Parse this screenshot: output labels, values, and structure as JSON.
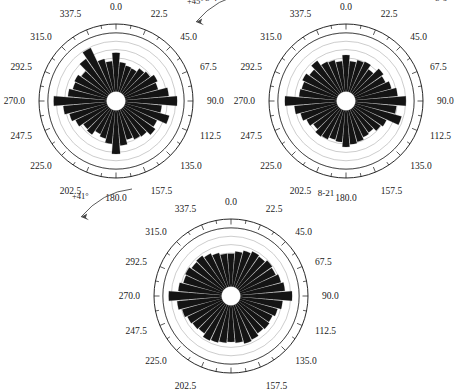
{
  "figure": {
    "type": "rose-diagram-figure",
    "panel_count": 3,
    "background": "#ffffff",
    "petal_color": "#141414",
    "grid_color": "#9a9a9a",
    "axis_color": "#111111"
  },
  "chart_data": [
    {
      "type": "bar",
      "subtype": "polar-rose",
      "id": "8-4",
      "rotation_label": "+179°",
      "title": "8-4",
      "xlabel": "",
      "ylabel": "",
      "bin_width_deg": 10,
      "n_bins": 36,
      "grid_rings": 7,
      "inner_blank_fraction": 0.14,
      "rlim": [
        0,
        1
      ],
      "tick_interval_deg": 11.25,
      "tick_labels": [
        "0.0",
        "22.5",
        "45.0",
        "67.5",
        "90.0",
        "112.5",
        "135.0",
        "157.5",
        "180.0",
        "202.5",
        "225.0",
        "247.5",
        "270.0",
        "292.5",
        "315.0",
        "337.5"
      ],
      "tick_label_angles": [
        0,
        22.5,
        45,
        67.5,
        90,
        112.5,
        135,
        157.5,
        180,
        202.5,
        225,
        247.5,
        270,
        292.5,
        315,
        337.5
      ],
      "categories": [
        0,
        10,
        20,
        30,
        40,
        50,
        60,
        70,
        80,
        90,
        100,
        110,
        120,
        130,
        140,
        150,
        160,
        170,
        180,
        190,
        200,
        210,
        220,
        230,
        240,
        250,
        260,
        270,
        280,
        290,
        300,
        310,
        320,
        330,
        340,
        350
      ],
      "values": [
        0.66,
        0.5,
        0.46,
        0.45,
        0.52,
        0.55,
        0.62,
        0.58,
        0.74,
        0.88,
        0.62,
        0.78,
        0.61,
        0.66,
        0.58,
        0.56,
        0.52,
        0.6,
        0.74,
        0.57,
        0.5,
        0.46,
        0.54,
        0.52,
        0.6,
        0.66,
        0.74,
        0.9,
        0.66,
        0.6,
        0.62,
        0.56,
        0.72,
        0.84,
        0.58,
        0.52
      ],
      "legend": []
    },
    {
      "type": "bar",
      "subtype": "polar-rose",
      "id": "8-6",
      "rotation_label": "+45°",
      "title": "8-6",
      "xlabel": "",
      "ylabel": "",
      "bin_width_deg": 10,
      "n_bins": 36,
      "grid_rings": 7,
      "inner_blank_fraction": 0.14,
      "rlim": [
        0,
        1
      ],
      "tick_interval_deg": 11.25,
      "tick_labels": [
        "0.0",
        "22.5",
        "45.0",
        "67.5",
        "90.0",
        "112.5",
        "135.0",
        "157.5",
        "180.0",
        "202.5",
        "225.0",
        "247.5",
        "270.0",
        "292.5",
        "315.0",
        "337.5"
      ],
      "tick_label_angles": [
        0,
        22.5,
        45,
        67.5,
        90,
        112.5,
        135,
        157.5,
        180,
        202.5,
        225,
        247.5,
        270,
        292.5,
        315,
        337.5
      ],
      "categories": [
        0,
        10,
        20,
        30,
        40,
        50,
        60,
        70,
        80,
        90,
        100,
        110,
        120,
        130,
        140,
        150,
        160,
        170,
        180,
        190,
        200,
        210,
        220,
        230,
        240,
        250,
        260,
        270,
        280,
        290,
        300,
        310,
        320,
        330,
        340,
        350
      ],
      "values": [
        0.62,
        0.52,
        0.56,
        0.58,
        0.5,
        0.62,
        0.58,
        0.64,
        0.72,
        0.86,
        0.7,
        0.82,
        0.6,
        0.56,
        0.5,
        0.52,
        0.56,
        0.58,
        0.62,
        0.54,
        0.52,
        0.56,
        0.58,
        0.52,
        0.58,
        0.64,
        0.72,
        0.88,
        0.64,
        0.62,
        0.66,
        0.6,
        0.68,
        0.58,
        0.56,
        0.52
      ],
      "legend": []
    },
    {
      "type": "bar",
      "subtype": "polar-rose",
      "id": "8-21",
      "rotation_label": "+41°",
      "title": "8-21",
      "xlabel": "",
      "ylabel": "",
      "bin_width_deg": 10,
      "n_bins": 36,
      "grid_rings": 7,
      "inner_blank_fraction": 0.14,
      "rlim": [
        0,
        1
      ],
      "tick_interval_deg": 11.25,
      "tick_labels": [
        "0.0",
        "22.5",
        "45.0",
        "67.5",
        "90.0",
        "112.5",
        "135.0",
        "157.5",
        "180.0",
        "202.5",
        "225.0",
        "247.5",
        "270.0",
        "292.5",
        "315.0",
        "337.5"
      ],
      "tick_label_angles": [
        0,
        22.5,
        45,
        67.5,
        90,
        112.5,
        135,
        157.5,
        180,
        202.5,
        225,
        247.5,
        270,
        292.5,
        315,
        337.5
      ],
      "categories": [
        0,
        10,
        20,
        30,
        40,
        50,
        60,
        70,
        80,
        90,
        100,
        110,
        120,
        130,
        140,
        150,
        160,
        170,
        180,
        190,
        200,
        210,
        220,
        230,
        240,
        250,
        260,
        270,
        280,
        290,
        300,
        310,
        320,
        330,
        340,
        350
      ],
      "values": [
        0.56,
        0.6,
        0.64,
        0.68,
        0.66,
        0.7,
        0.68,
        0.72,
        0.76,
        0.88,
        0.72,
        0.66,
        0.62,
        0.64,
        0.62,
        0.66,
        0.68,
        0.64,
        0.62,
        0.64,
        0.66,
        0.68,
        0.62,
        0.64,
        0.66,
        0.7,
        0.76,
        0.9,
        0.74,
        0.68,
        0.7,
        0.66,
        0.68,
        0.64,
        0.6,
        0.56
      ],
      "legend": []
    }
  ],
  "panels": [
    {
      "id_label": "8-4",
      "rotation_label": "+179°"
    },
    {
      "id_label": "8-6",
      "rotation_label": "+45°"
    },
    {
      "id_label": "8-21",
      "rotation_label": "+41°"
    }
  ]
}
